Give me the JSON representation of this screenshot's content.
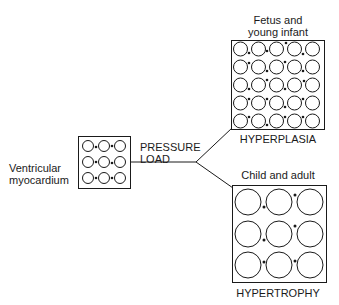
{
  "left": {
    "label_line1": "Ventricular",
    "label_line2": "myocardium"
  },
  "stimulus": {
    "line1": "PRESSURE",
    "line2": "LOAD"
  },
  "top_branch": {
    "title_line1": "Fetus and",
    "title_line2": "young infant",
    "caption": "HYPERPLASIA"
  },
  "bottom_branch": {
    "title": "Child and adult",
    "caption": "HYPERTROPHY"
  },
  "colors": {
    "ink": "#1a1a1a",
    "background": "#ffffff"
  }
}
